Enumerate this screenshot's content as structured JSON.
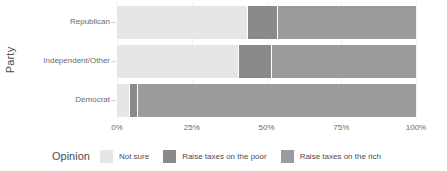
{
  "chart_data": {
    "type": "bar",
    "orientation": "horizontal",
    "stacked": true,
    "normalized": true,
    "title": "",
    "xlabel": "",
    "ylabel": "Party",
    "xlim": [
      0,
      100
    ],
    "grid": false,
    "legend_position": "bottom",
    "categories": [
      "Republican",
      "Independent/Other",
      "Democrat"
    ],
    "series": [
      {
        "name": "Not sure",
        "color": "#e6e6e6",
        "values": [
          43.5,
          40.5,
          4.0
        ]
      },
      {
        "name": "Raise taxes on the poor",
        "color": "#8a8a8a",
        "values": [
          10.0,
          11.0,
          2.7
        ]
      },
      {
        "name": "Raise taxes on the rich",
        "color": "#9b9b9b",
        "values": [
          46.5,
          48.5,
          93.3
        ]
      }
    ],
    "x_tick_labels": [
      "0%",
      "25%",
      "50%",
      "75%",
      "100%"
    ],
    "x_tick_values": [
      0,
      25,
      50,
      75,
      100
    ]
  },
  "axes": {
    "y_title": "Party",
    "y_tick_labels": [
      "Republican",
      "Independent/Other",
      "Democrat"
    ],
    "x_tick_labels": [
      "0%",
      "25%",
      "50%",
      "75%",
      "100%"
    ]
  },
  "legend": {
    "title": "Opinion",
    "items": [
      {
        "label": "Not sure",
        "color": "#e6e6e6"
      },
      {
        "label": "Raise taxes on the poor",
        "color": "#8a8a8a"
      },
      {
        "label": "Raise taxes on the rich",
        "color": "#9b9b9b"
      }
    ]
  },
  "colors": {
    "background": "#ffffff",
    "text": "#4d4d4d",
    "tick_text": "#6b6b6b",
    "gridline": "#f2f2f2",
    "not_sure": "#e6e6e6",
    "raise_taxes_poor": "#8a8a8a",
    "raise_taxes_rich": "#9b9b9b"
  }
}
